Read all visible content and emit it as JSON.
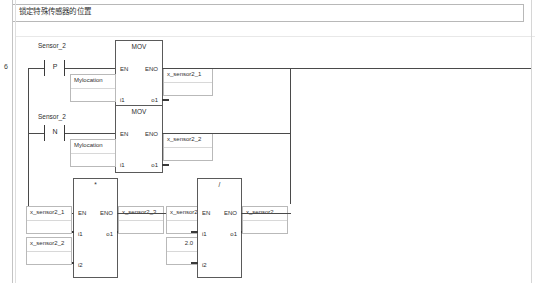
{
  "window": {
    "title_comment": "锁定特殊传感器的位置"
  },
  "rung": {
    "number": "6"
  },
  "contacts": [
    {
      "label": "Sensor_2",
      "mark": "P",
      "name": "contact-sensor2-rising"
    },
    {
      "label": "Sensor_2",
      "mark": "N",
      "name": "contact-sensor2-falling"
    }
  ],
  "blocks": [
    {
      "name": "mov-block-1",
      "title": "MOV",
      "pins": {
        "en": "EN",
        "eno": "ENO",
        "i1": "i1",
        "o1": "o1"
      }
    },
    {
      "name": "mov-block-2",
      "title": "MOV",
      "pins": {
        "en": "EN",
        "eno": "ENO",
        "i1": "i1",
        "o1": "o1"
      }
    },
    {
      "name": "multiply-block",
      "title": "*",
      "pins": {
        "en": "EN",
        "eno": "ENO",
        "i1": "i1",
        "i2": "i2",
        "o1": "o1"
      }
    },
    {
      "name": "divide-block",
      "title": "/",
      "pins": {
        "en": "EN",
        "eno": "ENO",
        "i1": "i1",
        "i2": "i2",
        "o1": "o1"
      }
    }
  ],
  "variables": {
    "mov1_input": "Mylocation",
    "mov1_output": "x_sensor2_1",
    "mov2_input": "Mylocation",
    "mov2_output": "x_sensor2_2",
    "mul_input1": "x_sensor2_1",
    "mul_input2": "x_sensor2_2",
    "mul_output": "x_sensor2_3",
    "div_input1": "x_sensor2_3",
    "div_input2": "2.0",
    "div_output": "x_sensor2"
  },
  "colors": {
    "wire": "#4a4a4a",
    "block_border": "#5a5a5a",
    "var_border": "#b9b9b9",
    "text": "#303030",
    "background": "#ffffff"
  }
}
